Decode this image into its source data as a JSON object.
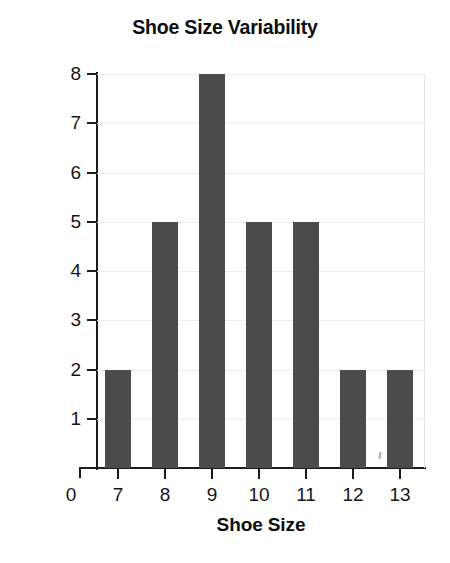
{
  "chart_data": {
    "type": "bar",
    "title": "Shoe Size Variability",
    "xlabel": "Shoe Size",
    "ylabel": "Number of Students",
    "categories": [
      "7",
      "8",
      "9",
      "10",
      "11",
      "12",
      "13"
    ],
    "values": [
      2,
      5,
      8,
      5,
      5,
      2,
      2
    ],
    "ylim": [
      0,
      8
    ],
    "yticks": [
      "1",
      "2",
      "3",
      "4",
      "5",
      "6",
      "7",
      "8"
    ],
    "xticks": [
      "7",
      "8",
      "9",
      "10",
      "11",
      "12",
      "13"
    ],
    "origin_label": "0",
    "grid": true,
    "legend": "none",
    "bar_color": "#4b4b4b",
    "axis_color": "#1c1c1c",
    "gridline_color": "#ededed",
    "background_color": "#ffffff"
  }
}
